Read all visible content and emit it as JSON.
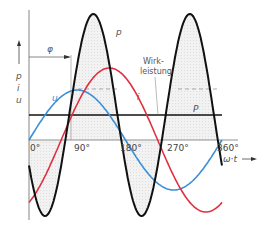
{
  "chart_data": {
    "type": "line",
    "title": "",
    "xlabel": "ω·t",
    "ylabel": "p, i, u",
    "x_ticks": [
      "0°",
      "90°",
      "180°",
      "270°",
      "360°"
    ],
    "phase_angle_label": "φ",
    "phase_angle_deg": 60,
    "series": [
      {
        "name": "u",
        "color": "#3a8fd6",
        "description": "voltage sine, amplitude 1, phase 0°"
      },
      {
        "name": "i",
        "color": "#e03040",
        "description": "current sine, amplitude 1.4, lagging by φ≈60°"
      },
      {
        "name": "p",
        "color": "#111111",
        "description": "instantaneous power p = u·i, double frequency, shaded"
      },
      {
        "name": "P",
        "color": "#111111",
        "description": "active power (mean of p), horizontal line"
      }
    ],
    "annotations": [
      "Wirk-",
      "leistung"
    ]
  },
  "labels": {
    "axis_p": "p",
    "axis_i": "i",
    "axis_u": "u",
    "curve_u": "u",
    "curve_i": "i",
    "curve_p": "p",
    "curve_P": "P",
    "phi": "φ",
    "wirk1": "Wirk-",
    "wirk2": "leistung",
    "x_axis": "ω·t",
    "t0": "0°",
    "t90": "90°",
    "t180": "180°",
    "t270": "270°",
    "t360": "360°"
  }
}
